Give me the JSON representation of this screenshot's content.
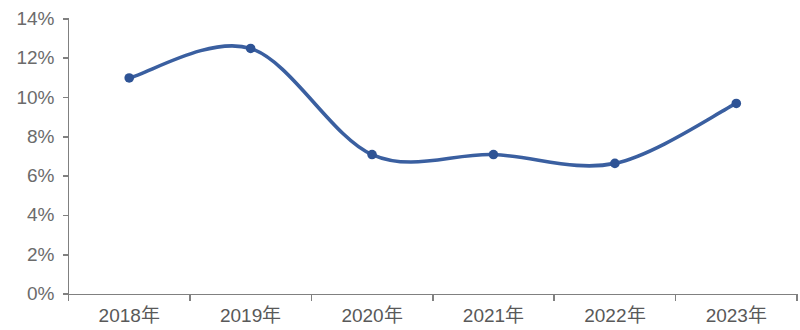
{
  "chart_data": {
    "type": "line",
    "title": "",
    "subtitle": "",
    "xlabel": "",
    "ylabel": "",
    "categories": [
      "2018年",
      "2019年",
      "2020年",
      "2021年",
      "2022年",
      "2023年"
    ],
    "values": [
      11.0,
      12.5,
      7.1,
      7.1,
      6.65,
      9.7
    ],
    "series": [
      {
        "name": "",
        "values": [
          11.0,
          12.5,
          7.1,
          7.1,
          6.65,
          9.7
        ]
      }
    ],
    "ylim": [
      0,
      14
    ],
    "ytick_values": [
      0,
      2,
      4,
      6,
      8,
      10,
      12,
      14
    ],
    "ytick_labels": [
      "0%",
      "2%",
      "4%",
      "6%",
      "8%",
      "10%",
      "12%",
      "14%"
    ],
    "value_format": "percent",
    "grid": false,
    "legend": false,
    "legend_position": "none",
    "smoothing": "spline",
    "markers": true,
    "colors": {
      "line": "#3a5fa0",
      "marker": "#2e5395",
      "axis": "#808080",
      "ytick_label": "#6b6b6b",
      "xtick_label": "#595959",
      "background": "#ffffff"
    }
  }
}
